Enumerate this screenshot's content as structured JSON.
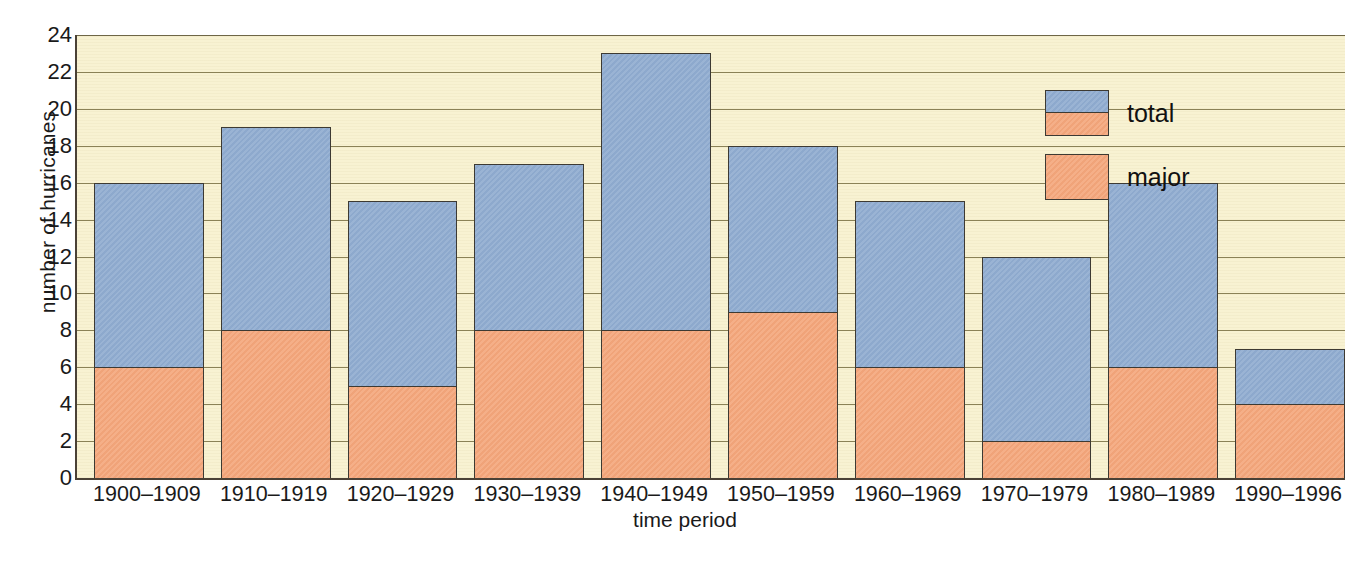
{
  "chart_data": {
    "type": "bar",
    "subtype": "overlaid-stacked",
    "title": "",
    "xlabel": "time period",
    "ylabel": "number of hurricanes",
    "categories": [
      "1900–1909",
      "1910–1919",
      "1920–1929",
      "1930–1939",
      "1940–1949",
      "1950–1959",
      "1960–1969",
      "1970–1979",
      "1980–1989",
      "1990–1996"
    ],
    "series": [
      {
        "name": "total",
        "color": "#8fabcf",
        "values": [
          16,
          19,
          15,
          17,
          23,
          18,
          15,
          12,
          16,
          7
        ]
      },
      {
        "name": "major",
        "color": "#f4a67b",
        "values": [
          6,
          8,
          5,
          8,
          8,
          9,
          6,
          2,
          6,
          4
        ]
      }
    ],
    "ylim": [
      0,
      24
    ],
    "ytick_step": 2,
    "yticks": [
      "24",
      "22",
      "20",
      "18",
      "16",
      "14",
      "12",
      "10",
      "8",
      "6",
      "4",
      "2",
      "0"
    ],
    "grid": true,
    "grid_axis": "y",
    "legend_position": "top-right",
    "plot_background": "#f8f2d2",
    "gridline_color": "#8a8156",
    "axis_color": "#4a4136",
    "bar_outline_color": "#3d3a33"
  },
  "legend": {
    "entries": [
      {
        "label": "total",
        "swatch": "stacked-blue-over-orange"
      },
      {
        "label": "major",
        "swatch": "solid-orange"
      }
    ]
  },
  "caption": {
    "cutoff_text": ""
  }
}
